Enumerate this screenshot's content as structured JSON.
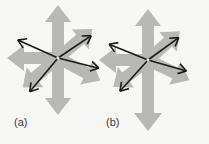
{
  "figure": {
    "kind": "vector-diagram",
    "background_color": "#f7f7f5",
    "block_arrow_color": "#b8b8b5",
    "block_arrow_shadow_color": "#a8a8a4",
    "line_arrow_color": "#1a1a1a",
    "label_color": "#3a3a3a"
  },
  "panels": [
    {
      "id": "a",
      "label": "(a)",
      "center": {
        "x": 58,
        "y": 58
      },
      "block_arrows": [
        {
          "name": "block-arrow-up",
          "direction": "up",
          "angle_deg": 90,
          "length": 52
        },
        {
          "name": "block-arrow-down",
          "direction": "down",
          "angle_deg": 270,
          "length": 56
        },
        {
          "name": "block-arrow-left",
          "direction": "left",
          "angle_deg": 180,
          "length": 50
        },
        {
          "name": "block-arrow-upper-right",
          "direction": "upper-right",
          "angle_deg": 40,
          "length": 44
        },
        {
          "name": "block-arrow-lower-right",
          "direction": "lower-right",
          "angle_deg": -28,
          "length": 48
        },
        {
          "name": "block-arrow-lower-left",
          "direction": "lower-left",
          "angle_deg": -140,
          "length": 46
        }
      ],
      "line_arrows": [
        {
          "name": "line-arrow-upper-left",
          "direction": "upper-left",
          "angle_deg": 156,
          "length": 44
        },
        {
          "name": "line-arrow-upper-right",
          "direction": "upper-right",
          "angle_deg": 34,
          "length": 40
        },
        {
          "name": "line-arrow-lower-left",
          "direction": "lower-left",
          "angle_deg": -130,
          "length": 44
        },
        {
          "name": "line-arrow-lower-right",
          "direction": "lower-right",
          "angle_deg": -14,
          "length": 42
        }
      ]
    },
    {
      "id": "b",
      "label": "(b)",
      "center": {
        "x": 148,
        "y": 60
      },
      "block_arrows": [
        {
          "name": "block-arrow-up",
          "direction": "up",
          "angle_deg": 90,
          "length": 50
        },
        {
          "name": "block-arrow-down",
          "direction": "down",
          "angle_deg": 270,
          "length": 70
        },
        {
          "name": "block-arrow-left",
          "direction": "left",
          "angle_deg": 180,
          "length": 48
        },
        {
          "name": "block-arrow-upper-right",
          "direction": "upper-right",
          "angle_deg": 42,
          "length": 42
        },
        {
          "name": "block-arrow-lower-right",
          "direction": "lower-right",
          "angle_deg": -26,
          "length": 46
        },
        {
          "name": "block-arrow-lower-left",
          "direction": "lower-left",
          "angle_deg": -142,
          "length": 44
        }
      ],
      "line_arrows": [
        {
          "name": "line-arrow-upper-left",
          "direction": "upper-left",
          "angle_deg": 158,
          "length": 42
        },
        {
          "name": "line-arrow-upper-right",
          "direction": "upper-right",
          "angle_deg": 36,
          "length": 38
        },
        {
          "name": "line-arrow-lower-left",
          "direction": "lower-left",
          "angle_deg": -132,
          "length": 42
        },
        {
          "name": "line-arrow-lower-right",
          "direction": "lower-right",
          "angle_deg": -16,
          "length": 40
        }
      ]
    }
  ]
}
